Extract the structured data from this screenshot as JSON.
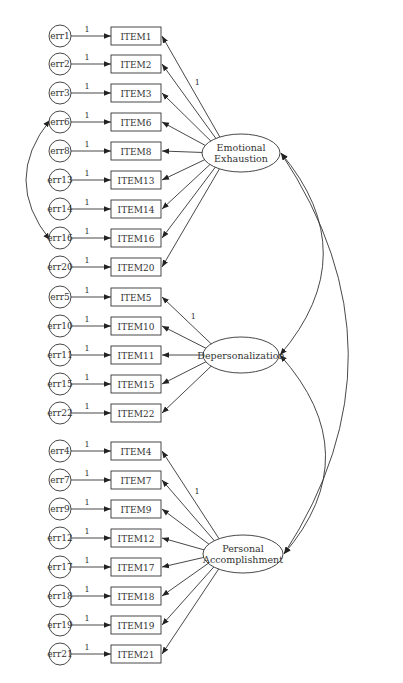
{
  "diagram": {
    "type": "cfa-path-diagram",
    "colors": {
      "line": "#333333",
      "background": "#ffffff"
    },
    "factors": [
      {
        "id": "EE",
        "label_lines": [
          "Emotional",
          "Exhaustion"
        ],
        "cx": 241,
        "cy": 153,
        "rx": 39,
        "ry": 19
      },
      {
        "id": "DP",
        "label_lines": [
          "Depersonalization"
        ],
        "cx": 241,
        "cy": 355,
        "rx": 38,
        "ry": 18
      },
      {
        "id": "PA",
        "label_lines": [
          "Personal",
          "Accomplishment"
        ],
        "cx": 243,
        "cy": 554,
        "rx": 40,
        "ry": 19
      }
    ],
    "indicators": [
      {
        "err": "err1",
        "item": "ITEM1",
        "y": 36,
        "factor": "EE",
        "loading_label": "1"
      },
      {
        "err": "err2",
        "item": "ITEM2",
        "y": 64,
        "factor": "EE",
        "loading_label": ""
      },
      {
        "err": "err3",
        "item": "ITEM3",
        "y": 93,
        "factor": "EE",
        "loading_label": ""
      },
      {
        "err": "err6",
        "item": "ITEM6",
        "y": 122,
        "factor": "EE",
        "loading_label": ""
      },
      {
        "err": "err8",
        "item": "ITEM8",
        "y": 151,
        "factor": "EE",
        "loading_label": ""
      },
      {
        "err": "err13",
        "item": "ITEM13",
        "y": 180,
        "factor": "EE",
        "loading_label": ""
      },
      {
        "err": "err14",
        "item": "ITEM14",
        "y": 209,
        "factor": "EE",
        "loading_label": ""
      },
      {
        "err": "err16",
        "item": "ITEM16",
        "y": 238,
        "factor": "EE",
        "loading_label": ""
      },
      {
        "err": "err20",
        "item": "ITEM20",
        "y": 267,
        "factor": "EE",
        "loading_label": ""
      },
      {
        "err": "err5",
        "item": "ITEM5",
        "y": 297,
        "factor": "DP",
        "loading_label": "1"
      },
      {
        "err": "err10",
        "item": "ITEM10",
        "y": 326,
        "factor": "DP",
        "loading_label": ""
      },
      {
        "err": "err11",
        "item": "ITEM11",
        "y": 355,
        "factor": "DP",
        "loading_label": ""
      },
      {
        "err": "err15",
        "item": "ITEM15",
        "y": 384,
        "factor": "DP",
        "loading_label": ""
      },
      {
        "err": "err22",
        "item": "ITEM22",
        "y": 413,
        "factor": "DP",
        "loading_label": ""
      },
      {
        "err": "err4",
        "item": "ITEM4",
        "y": 451,
        "factor": "PA",
        "loading_label": "1"
      },
      {
        "err": "err7",
        "item": "ITEM7",
        "y": 480,
        "factor": "PA",
        "loading_label": ""
      },
      {
        "err": "err9",
        "item": "ITEM9",
        "y": 509,
        "factor": "PA",
        "loading_label": ""
      },
      {
        "err": "err12",
        "item": "ITEM12",
        "y": 538,
        "factor": "PA",
        "loading_label": ""
      },
      {
        "err": "err17",
        "item": "ITEM17",
        "y": 567,
        "factor": "PA",
        "loading_label": ""
      },
      {
        "err": "err18",
        "item": "ITEM18",
        "y": 596,
        "factor": "PA",
        "loading_label": ""
      },
      {
        "err": "err19",
        "item": "ITEM19",
        "y": 625,
        "factor": "PA",
        "loading_label": ""
      },
      {
        "err": "err21",
        "item": "ITEM21",
        "y": 654,
        "factor": "PA",
        "loading_label": ""
      }
    ],
    "error_path_label": "1",
    "factor_covariances": [
      {
        "from": "EE",
        "to": "DP"
      },
      {
        "from": "DP",
        "to": "PA"
      },
      {
        "from": "EE",
        "to": "PA"
      }
    ],
    "error_covariances": [
      {
        "from": "err6",
        "to": "err16"
      }
    ]
  }
}
